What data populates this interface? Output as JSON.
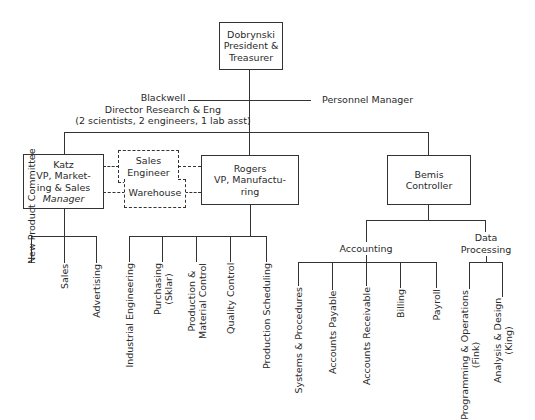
{
  "president": {
    "name": "Dobrynski",
    "line1": "President &",
    "line2": "Treasurer"
  },
  "staff": {
    "research": {
      "name": "Blackwell",
      "title": "Director Research & Eng",
      "note": "(2 scientists, 2 engineers, 1 lab asst)"
    },
    "personnel": {
      "title": "Personnel Manager"
    }
  },
  "vps": {
    "marketing": {
      "name": "Katz",
      "line1": "VP, Market-",
      "line2": "ing & Sales",
      "line3": "Manager"
    },
    "manufacturing": {
      "name": "Rogers",
      "line1": "VP, Manufactu-",
      "line2": "ring"
    },
    "controller": {
      "name": "Bemis",
      "title": "Controller"
    }
  },
  "shared_units": {
    "sales_engineer": {
      "line1": "Sales",
      "line2": "Engineer"
    },
    "warehouse": {
      "label": "Warehouse"
    }
  },
  "marketing_units": [
    "New Product Committee",
    "Sales",
    "Advertising"
  ],
  "manufacturing_units": [
    {
      "line1": "Industrial Engineering"
    },
    {
      "line1": "Purchasing",
      "line2": "(Sklar)"
    },
    {
      "line1": "Production &",
      "line2": "Material Control"
    },
    {
      "line1": "Quality Control"
    },
    {
      "line1": "Production Scheduling"
    }
  ],
  "controller_groups": {
    "accounting": {
      "label": "Accounting",
      "units": [
        "Systems & Procedures",
        "Accounts Payable",
        "Accounts Receivable",
        "Billing",
        "Payroll"
      ]
    },
    "data_processing": {
      "line1": "Data",
      "line2": "Processing",
      "units": [
        {
          "line1": "Programming & Operations",
          "line2": "(Fink)"
        },
        {
          "line1": "Analysis & Design",
          "line2": "(King)"
        }
      ]
    }
  }
}
